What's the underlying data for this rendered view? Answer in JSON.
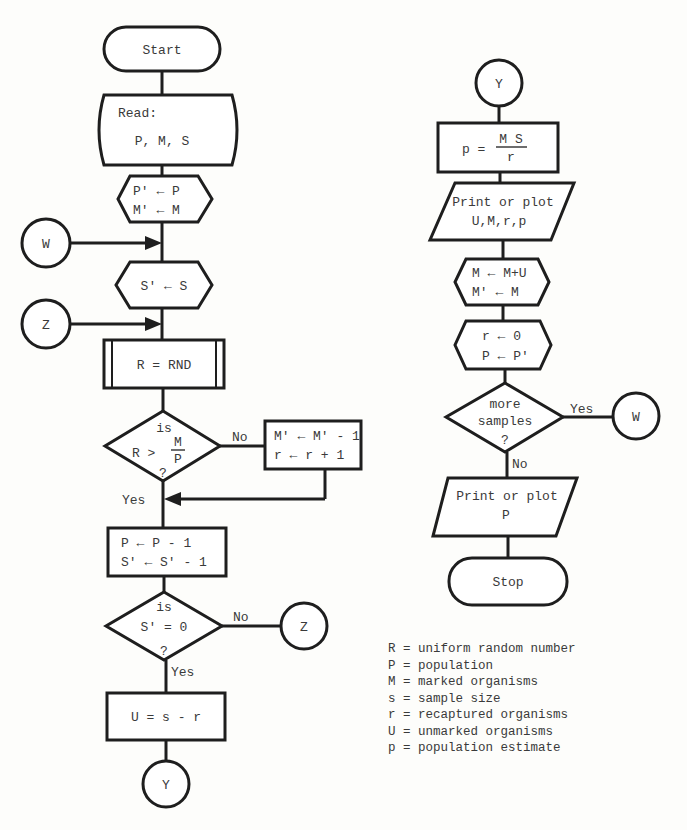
{
  "diagram": {
    "type": "flowchart",
    "left_column": {
      "start": {
        "label": "Start"
      },
      "read": {
        "line1": "Read:",
        "line2": "P, M, S"
      },
      "init1": {
        "line1": "P' ← P",
        "line2": "M' ← M"
      },
      "connector_w": {
        "label": "W"
      },
      "init2": {
        "label": "S' ← S"
      },
      "connector_z": {
        "label": "Z"
      },
      "random": {
        "label": "R = RND"
      },
      "decision1": {
        "line1": "is",
        "lhs": "R >",
        "frac_num": "M",
        "frac_den": "P",
        "line3": "?",
        "no_label": "No",
        "yes_label": "Yes"
      },
      "recapture": {
        "line1": "M' ← M' - 1",
        "line2": "r ← r + 1"
      },
      "decrement": {
        "line1": "P ← P - 1",
        "line2": "S' ← S' - 1"
      },
      "decision2": {
        "line1": "is",
        "line2": "S' = 0",
        "line3": "?",
        "no_label": "No",
        "yes_label": "Yes"
      },
      "connector_z_out": {
        "label": "Z"
      },
      "unmarked": {
        "label": "U = s - r"
      },
      "connector_y_out": {
        "label": "Y"
      }
    },
    "right_column": {
      "connector_y": {
        "label": "Y"
      },
      "estimate": {
        "lhs": "p =",
        "frac_num": "M S",
        "frac_den": "r"
      },
      "print1": {
        "line1": "Print or plot",
        "line2": "U,M,r,p"
      },
      "update": {
        "line1": "M ← M+U",
        "line2": "M' ← M"
      },
      "reset": {
        "line1": "r ← 0",
        "line2": "P ← P'"
      },
      "decision3": {
        "line1": "more",
        "line2": "samples",
        "line3": "?",
        "yes_label": "Yes",
        "no_label": "No"
      },
      "connector_w_out": {
        "label": "W"
      },
      "print2": {
        "line1": "Print or plot",
        "line2": "P"
      },
      "stop": {
        "label": "Stop"
      }
    },
    "legend": [
      "R = uniform random number",
      "P = population",
      "M = marked organisms",
      "s = sample size",
      "r = recaptured organisms",
      "U = unmarked organisms",
      "p = population estimate"
    ]
  }
}
